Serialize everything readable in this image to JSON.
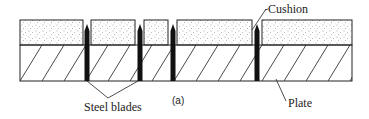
{
  "diagram": {
    "type": "cross-section",
    "figure_label": "(a)",
    "labels": {
      "cushion": "Cushion",
      "steel_blades": "Steel blades",
      "plate": "Plate"
    },
    "layers": [
      {
        "name": "cushion",
        "pattern": "stippled",
        "top": 20,
        "bottom": 45
      },
      {
        "name": "plate",
        "pattern": "diagonal-hatch",
        "top": 45,
        "bottom": 81
      }
    ],
    "cushion_blocks": [
      {
        "x1": 20,
        "x2": 83
      },
      {
        "x1": 91,
        "x2": 135
      },
      {
        "x1": 144,
        "x2": 168
      },
      {
        "x1": 177,
        "x2": 252
      },
      {
        "x1": 262,
        "x2": 352
      }
    ],
    "blade_positions_x": [
      87,
      140,
      173,
      257
    ],
    "colors": {
      "line": "#222222",
      "blade": "#111111",
      "background": "#ffffff"
    }
  }
}
